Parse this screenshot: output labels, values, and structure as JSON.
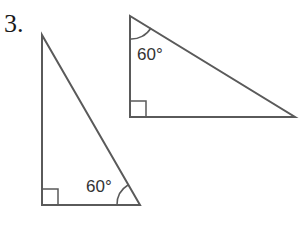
{
  "problem_number": "3.",
  "triangles": [
    {
      "id": "left",
      "angle_label": "60°",
      "angle_at": "bottom-right",
      "right_angle_at": "bottom-left"
    },
    {
      "id": "right",
      "angle_label": "60°",
      "angle_at": "top-left",
      "right_angle_at": "bottom-left"
    }
  ],
  "colors": {
    "stroke": "#555555",
    "text": "#333333"
  }
}
